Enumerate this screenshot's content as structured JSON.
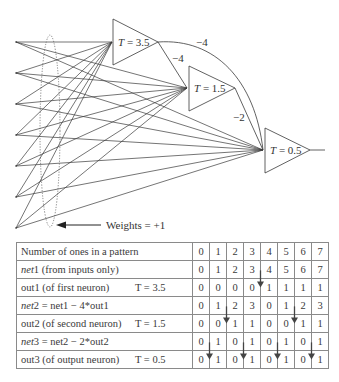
{
  "diagram": {
    "neurons": [
      {
        "id": "n1",
        "label_var": "T",
        "label_eq": " = 3.5"
      },
      {
        "id": "n2",
        "label_var": "T",
        "label_eq": " = 1.5"
      },
      {
        "id": "n3",
        "label_var": "T",
        "label_eq": " = 0.5"
      }
    ],
    "weights": {
      "n1_to_n3": "−4",
      "n1_to_n2": "−4",
      "n2_to_n3": "−2",
      "inputs": "Weights = +1"
    },
    "input_count": 7
  },
  "table": {
    "columns": [
      "0",
      "1",
      "2",
      "3",
      "4",
      "5",
      "6",
      "7"
    ],
    "rows": [
      {
        "label_it": "",
        "label": "Number of ones in a pattern",
        "threshold": "",
        "values": [
          "0",
          "1",
          "2",
          "3",
          "4",
          "5",
          "6",
          "7"
        ]
      },
      {
        "label_it": "net",
        "label": "1 (from inputs only)",
        "threshold": "",
        "values": [
          "0",
          "1",
          "2",
          "3",
          "4",
          "5",
          "6",
          "7"
        ]
      },
      {
        "label_it": "",
        "label": "out1 (of first neuron)",
        "threshold": "T = 3.5",
        "values": [
          "0",
          "0",
          "0",
          "0",
          "1",
          "1",
          "1",
          "1"
        ]
      },
      {
        "label_it": "net",
        "label": "2 = net1 − 4*out1",
        "threshold": "",
        "values": [
          "0",
          "1",
          "2",
          "3",
          "0",
          "1",
          "2",
          "3"
        ]
      },
      {
        "label_it": "",
        "label": "out2 (of second neuron)",
        "threshold": "T = 1.5",
        "values": [
          "0",
          "0",
          "1",
          "1",
          "0",
          "0",
          "1",
          "1"
        ]
      },
      {
        "label_it": "net",
        "label": "3 = net2 − 2*out2",
        "threshold": "",
        "values": [
          "0",
          "1",
          "0",
          "1",
          "0",
          "1",
          "0",
          "1"
        ]
      },
      {
        "label_it": "",
        "label": "out3 (of output neuron)",
        "threshold": "T = 0.5",
        "values": [
          "0",
          "1",
          "0",
          "1",
          "0",
          "1",
          "0",
          "1"
        ]
      }
    ]
  }
}
